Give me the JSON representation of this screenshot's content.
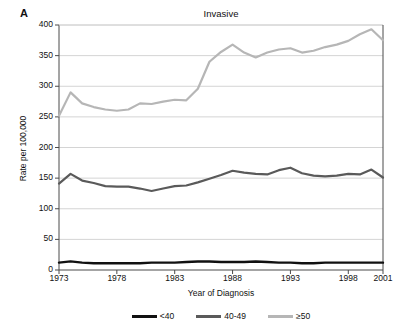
{
  "figure": {
    "panel_label": "A",
    "title": "Invasive"
  },
  "axes": {
    "xlabel": "Year of Diagnosis",
    "ylabel": "Rate per 100,000",
    "ytick_labels": [
      "0",
      "50",
      "100",
      "150",
      "200",
      "250",
      "300",
      "350",
      "400"
    ],
    "xtick_labels": [
      "1973",
      "1978",
      "1983",
      "1988",
      "1993",
      "1998",
      "2001"
    ]
  },
  "legend": {
    "entries": [
      {
        "label": "<40",
        "color": "#111111"
      },
      {
        "label": "40-49",
        "color": "#5a5a5a"
      },
      {
        "label": "≥50",
        "color": "#b6b6b6"
      }
    ]
  },
  "colors": {
    "under40": "#111111",
    "age40to49": "#5a5a5a",
    "age50plus": "#b6b6b6",
    "grid": "#d4d4d4",
    "axis": "#4a4a4a",
    "background": "#ffffff"
  },
  "chart_data": {
    "type": "line",
    "title": "Invasive",
    "xlabel": "Year of Diagnosis",
    "ylabel": "Rate per 100,000",
    "xlim": [
      1973,
      2001
    ],
    "ylim": [
      0,
      400
    ],
    "yticks": [
      0,
      50,
      100,
      150,
      200,
      250,
      300,
      350,
      400
    ],
    "xticks": [
      1973,
      1978,
      1983,
      1988,
      1993,
      1998,
      2001
    ],
    "grid": true,
    "legend_position": "bottom",
    "x": [
      1973,
      1974,
      1975,
      1976,
      1977,
      1978,
      1979,
      1980,
      1981,
      1982,
      1983,
      1984,
      1985,
      1986,
      1987,
      1988,
      1989,
      1990,
      1991,
      1992,
      1993,
      1994,
      1995,
      1996,
      1997,
      1998,
      1999,
      2000,
      2001
    ],
    "series": [
      {
        "name": "<40",
        "color": "#111111",
        "values": [
          12,
          14,
          12,
          11,
          11,
          11,
          11,
          11,
          12,
          12,
          12,
          13,
          14,
          14,
          13,
          13,
          13,
          14,
          13,
          12,
          12,
          11,
          11,
          12,
          12,
          12,
          12,
          12,
          12
        ]
      },
      {
        "name": "40-49",
        "color": "#5a5a5a",
        "values": [
          141,
          157,
          146,
          142,
          137,
          136,
          136,
          133,
          129,
          133,
          137,
          138,
          143,
          149,
          155,
          162,
          159,
          157,
          156,
          163,
          167,
          158,
          154,
          153,
          154,
          157,
          156,
          164,
          151
        ]
      },
      {
        "name": "≥50",
        "color": "#b6b6b6",
        "values": [
          252,
          290,
          272,
          266,
          262,
          260,
          262,
          272,
          271,
          275,
          278,
          277,
          296,
          340,
          356,
          368,
          355,
          347,
          355,
          360,
          362,
          355,
          358,
          364,
          368,
          374,
          385,
          393,
          375
        ]
      }
    ]
  }
}
